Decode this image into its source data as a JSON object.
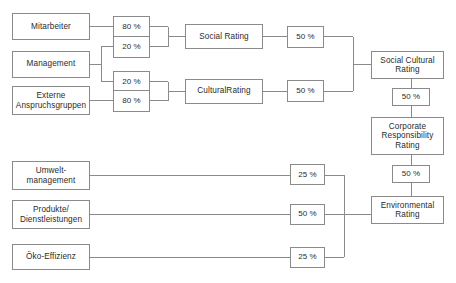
{
  "diagram": {
    "line_color": "#8a8a8a",
    "text_color": "#2b2b2b",
    "background": "#ffffff",
    "inputs_social": [
      {
        "id": "mitarbeiter",
        "label": "Mitarbeiter"
      },
      {
        "id": "management",
        "label": "Management"
      },
      {
        "id": "externe",
        "label": "Externe\nAnspruchsgruppen"
      }
    ],
    "inputs_environment": [
      {
        "id": "umwelt",
        "label": "Umwelt-\nmanagement"
      },
      {
        "id": "produkte",
        "label": "Produkte/\nDienstleistungen"
      },
      {
        "id": "oeko",
        "label": "Öko-Effizienz"
      }
    ],
    "weights_level1": [
      {
        "id": "w-mitarbeiter-social",
        "value": "80 %"
      },
      {
        "id": "w-management-social",
        "value": "20 %"
      },
      {
        "id": "w-management-cultural",
        "value": "20 %"
      },
      {
        "id": "w-externe-cultural",
        "value": "80 %"
      }
    ],
    "weights_level2": [
      {
        "id": "w-social-rating",
        "value": "50 %"
      },
      {
        "id": "w-cultural-rating",
        "value": "50 %"
      }
    ],
    "weights_environment": [
      {
        "id": "w-umwelt",
        "value": "25 %"
      },
      {
        "id": "w-produkte",
        "value": "50 %"
      },
      {
        "id": "w-oeko",
        "value": "25 %"
      }
    ],
    "weights_final": [
      {
        "id": "w-socialcultural-corporate",
        "value": "50 %"
      },
      {
        "id": "w-environmental-corporate",
        "value": "50 %"
      }
    ],
    "mid_ratings": [
      {
        "id": "social-rating",
        "label": "Social Rating"
      },
      {
        "id": "cultural-rating",
        "label": "CulturalRating"
      }
    ],
    "aggregate_ratings": [
      {
        "id": "social-cultural-rating",
        "label": "Social Cultural\nRating"
      },
      {
        "id": "environmental-rating",
        "label": "Environmental\nRating"
      }
    ],
    "final_rating": {
      "id": "corporate-responsibility-rating",
      "label": "Corporate\nResponsibility\nRating"
    },
    "caption": ""
  }
}
